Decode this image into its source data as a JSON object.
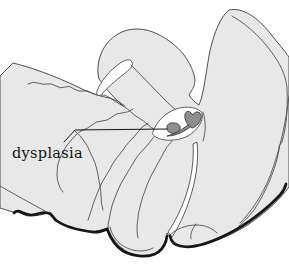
{
  "figure": {
    "label": "dysplasia",
    "colors": {
      "background": "#ffffff",
      "tissue_fill": "#e8e8e8",
      "contour": "#4f4f4f",
      "heavy_contour": "#161616",
      "lesion_fill": "#8f8f8f",
      "lesion_outline": "#3a3a3a",
      "label_text": "#141414"
    }
  }
}
